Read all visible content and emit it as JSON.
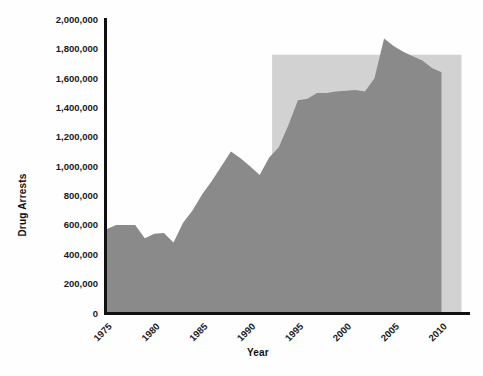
{
  "chart_data": {
    "type": "area",
    "title": "",
    "xlabel": "Year",
    "ylabel": "Drug Arrests",
    "xlim": [
      1975,
      2010
    ],
    "ylim": [
      0,
      2000000
    ],
    "grid": false,
    "legend": "none",
    "x_tick_labels": [
      "1975",
      "1980",
      "1985",
      "1990",
      "1995",
      "2000",
      "2005",
      "2010"
    ],
    "x_ticks": [
      1975,
      1980,
      1985,
      1990,
      1995,
      2000,
      2005,
      2010
    ],
    "y_tick_labels": [
      "0",
      "200,000",
      "400,000",
      "600,000",
      "800,000",
      "1,000,000",
      "1,200,000",
      "1,400,000",
      "1,600,000",
      "1,800,000",
      "2,000,000"
    ],
    "y_ticks": [
      0,
      200000,
      400000,
      600000,
      800000,
      1000000,
      1200000,
      1400000,
      1600000,
      1800000,
      2000000
    ],
    "series": [
      {
        "name": "Drug Arrests",
        "color": "#8a8a8a",
        "x": [
          1975,
          1976,
          1977,
          1978,
          1979,
          1980,
          1981,
          1982,
          1983,
          1984,
          1985,
          1986,
          1987,
          1988,
          1989,
          1990,
          1991,
          1992,
          1993,
          1994,
          1995,
          1996,
          1997,
          1998,
          1999,
          2000,
          2001,
          2002,
          2003,
          2004,
          2005,
          2006,
          2007,
          2008,
          2009,
          2010
        ],
        "values": [
          570000,
          600000,
          600000,
          600000,
          510000,
          540000,
          545000,
          480000,
          615000,
          700000,
          810000,
          900000,
          1000000,
          1100000,
          1055000,
          1000000,
          940000,
          1060000,
          1130000,
          1280000,
          1450000,
          1460000,
          1500000,
          1500000,
          1510000,
          1515000,
          1520000,
          1510000,
          1600000,
          1870000,
          1820000,
          1780000,
          1750000,
          1720000,
          1670000,
          1640000
        ]
      }
    ],
    "annotations": [
      {
        "name": "highlight-band",
        "type": "rect",
        "x_start": 1992.3,
        "x_end": 2010.0,
        "y_start": 0,
        "y_end": 1760000,
        "color": "#d2d2d2"
      }
    ]
  },
  "axes": {
    "y_axis_title": "Drug Arrests",
    "x_axis_title": "Year"
  }
}
